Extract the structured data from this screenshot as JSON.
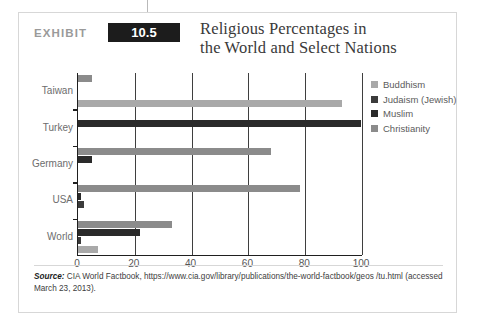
{
  "exhibit": {
    "label": "EXHIBIT",
    "number": "10.5"
  },
  "title": {
    "line1": "Religious Percentages in",
    "line2": "the World and Select Nations"
  },
  "source": {
    "label": "Source:",
    "text": " CIA World Factbook, https://www.cia.gov/library/publications/the-world-factbook/geos /tu.html (accessed March 23, 2013)."
  },
  "colors": {
    "buddhism": "#a9a9a9",
    "judaism": "#3b3b3b",
    "muslim": "#2a2a2a",
    "christianity": "#8b8b8b",
    "axis": "#1f1f1f",
    "grid": "#3f3f3f",
    "card_border": "#d7d7d7",
    "exhibit_box": "#1c1c1c"
  },
  "chart_data": {
    "type": "bar",
    "orientation": "horizontal",
    "title": "Religious Percentages in the World and Select Nations",
    "xlabel": "",
    "ylabel": "",
    "xlim": [
      0,
      100
    ],
    "xticks": [
      0,
      20,
      40,
      60,
      80,
      100
    ],
    "grid": true,
    "legend_position": "right",
    "categories": [
      "Taiwan",
      "Turkey",
      "Germany",
      "USA",
      "World"
    ],
    "series": [
      {
        "name": "Buddhism",
        "color": "#a9a9a9",
        "values": [
          93,
          0,
          0,
          0,
          7
        ]
      },
      {
        "name": "Judaism (Jewish)",
        "color": "#3b3b3b",
        "values": [
          0,
          0,
          0,
          2,
          1
        ]
      },
      {
        "name": "Muslim",
        "color": "#2a2a2a",
        "values": [
          0,
          99.8,
          5,
          1,
          22
        ]
      },
      {
        "name": "Christianity",
        "color": "#8b8b8b",
        "values": [
          5,
          0,
          68,
          78,
          33
        ]
      }
    ]
  }
}
